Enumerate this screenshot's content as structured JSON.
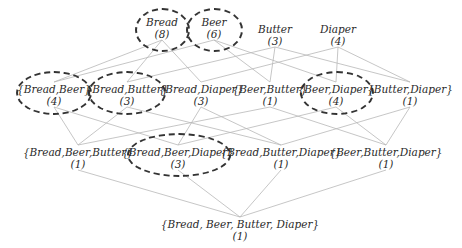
{
  "diagram": {
    "type": "itemset-lattice",
    "levels": [
      [
        {
          "id": "bread",
          "label": "Bread",
          "count": "(8)",
          "x": 162,
          "y": 16,
          "frequent": true
        },
        {
          "id": "beer",
          "label": "Beer",
          "count": "(6)",
          "x": 214,
          "y": 16,
          "frequent": true
        },
        {
          "id": "butter",
          "label": "Butter",
          "count": "(3)",
          "x": 275,
          "y": 23,
          "frequent": false
        },
        {
          "id": "diaper",
          "label": "Diaper",
          "count": "(4)",
          "x": 338,
          "y": 23,
          "frequent": false
        }
      ],
      [
        {
          "id": "bread-beer",
          "label": "{Bread,Beer}",
          "count": "(4)",
          "x": 54,
          "y": 83,
          "frequent": true
        },
        {
          "id": "bread-butter",
          "label": "{Bread,Butter}",
          "count": "(3)",
          "x": 127,
          "y": 83,
          "frequent": true
        },
        {
          "id": "bread-diaper",
          "label": "{Bread,Diaper}",
          "count": "(3)",
          "x": 201,
          "y": 83,
          "frequent": false
        },
        {
          "id": "beer-butter",
          "label": "{Beer,Butter}",
          "count": "(1)",
          "x": 270,
          "y": 83,
          "frequent": false
        },
        {
          "id": "beer-diaper",
          "label": "{Beer,Diaper}",
          "count": "(4)",
          "x": 336,
          "y": 83,
          "frequent": true
        },
        {
          "id": "butter-diaper",
          "label": "{Butter,Diaper}",
          "count": "(1)",
          "x": 410,
          "y": 83,
          "frequent": false
        }
      ],
      [
        {
          "id": "bread-beer-butter",
          "label": "{Bread,Beer,Butter}",
          "count": "(1)",
          "x": 78,
          "y": 146,
          "frequent": false
        },
        {
          "id": "bread-beer-diaper",
          "label": "{Bread,Beer,Diaper}",
          "count": "(3)",
          "x": 178,
          "y": 146,
          "frequent": true
        },
        {
          "id": "bread-butter-diaper",
          "label": "{Bread,Butter,Diaper}",
          "count": "(1)",
          "x": 281,
          "y": 146,
          "frequent": false
        },
        {
          "id": "beer-butter-diaper",
          "label": "{Beer,Butter,Diaper}",
          "count": "(1)",
          "x": 386,
          "y": 146,
          "frequent": false
        }
      ],
      [
        {
          "id": "all",
          "label": "{Bread, Beer, Butter, Diaper}",
          "count": "(1)",
          "x": 240,
          "y": 218,
          "frequent": false
        }
      ]
    ],
    "edges": [
      [
        "bread",
        "bread-beer"
      ],
      [
        "bread",
        "bread-butter"
      ],
      [
        "bread",
        "bread-diaper"
      ],
      [
        "beer",
        "bread-beer"
      ],
      [
        "beer",
        "beer-butter"
      ],
      [
        "beer",
        "beer-diaper"
      ],
      [
        "butter",
        "bread-butter"
      ],
      [
        "butter",
        "beer-butter"
      ],
      [
        "butter",
        "butter-diaper"
      ],
      [
        "diaper",
        "bread-diaper"
      ],
      [
        "diaper",
        "beer-diaper"
      ],
      [
        "diaper",
        "butter-diaper"
      ],
      [
        "bread-beer",
        "bread-beer-butter"
      ],
      [
        "bread-beer",
        "bread-beer-diaper"
      ],
      [
        "bread-butter",
        "bread-beer-butter"
      ],
      [
        "bread-butter",
        "bread-butter-diaper"
      ],
      [
        "bread-diaper",
        "bread-beer-diaper"
      ],
      [
        "bread-diaper",
        "bread-butter-diaper"
      ],
      [
        "beer-butter",
        "bread-beer-butter"
      ],
      [
        "beer-butter",
        "beer-butter-diaper"
      ],
      [
        "beer-diaper",
        "bread-beer-diaper"
      ],
      [
        "beer-diaper",
        "beer-butter-diaper"
      ],
      [
        "butter-diaper",
        "bread-butter-diaper"
      ],
      [
        "butter-diaper",
        "beer-butter-diaper"
      ],
      [
        "bread-beer-butter",
        "all"
      ],
      [
        "bread-beer-diaper",
        "all"
      ],
      [
        "bread-butter-diaper",
        "all"
      ],
      [
        "beer-butter-diaper",
        "all"
      ]
    ],
    "ellipses": [
      {
        "for": "bread",
        "x": 135,
        "y": 8,
        "w": 55,
        "h": 44
      },
      {
        "for": "beer",
        "x": 186,
        "y": 8,
        "w": 57,
        "h": 44
      },
      {
        "for": "bread-beer",
        "x": 16,
        "y": 71,
        "w": 76,
        "h": 44
      },
      {
        "for": "bread-butter",
        "x": 88,
        "y": 71,
        "w": 78,
        "h": 44
      },
      {
        "for": "beer-diaper",
        "x": 300,
        "y": 71,
        "w": 74,
        "h": 44
      },
      {
        "for": "bread-beer-diaper",
        "x": 127,
        "y": 133,
        "w": 104,
        "h": 44
      }
    ],
    "colors": {
      "edge": "#b8b8b8",
      "ellipse": "#333333",
      "text": "#2a2a2a"
    }
  }
}
